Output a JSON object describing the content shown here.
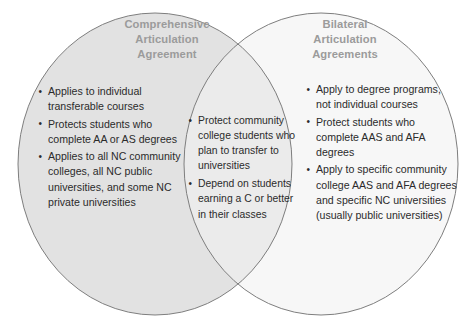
{
  "diagram": {
    "type": "venn",
    "kind": "two-set-venn-diagram",
    "colors": {
      "left_circle_fill": "#e2e2e2",
      "right_circle_fill": "#f7f7f7",
      "intersection_fill": "#ebebeb",
      "outline": "#7e7e7e",
      "title_text": "#9b9b9b",
      "body_text": "#2b2b2b",
      "background": "#ffffff"
    },
    "left": {
      "title": "Comprehensive Articulation Agreement",
      "title_lines": [
        "Comprehensive",
        "Articulation",
        "Agreement"
      ],
      "bullets": [
        "Applies to individual transferable courses",
        "Protects students who complete AA or AS degrees",
        "Applies to all NC community colleges, all NC public universities, and some NC private universities"
      ]
    },
    "intersection": {
      "bullets": [
        "Protect community college students who plan to transfer to universities",
        "Depend on students earning a C or better in their classes"
      ]
    },
    "right": {
      "title": "Bilateral Articulation Agreements",
      "title_lines": [
        "Bilateral",
        "Articulation",
        "Agreements"
      ],
      "bullets": [
        "Apply to degree programs, not individual courses",
        "Protect students who complete AAS and AFA degrees",
        "Apply to specific community college AAS and AFA degrees and specific NC universities (usually public universities)"
      ]
    }
  }
}
